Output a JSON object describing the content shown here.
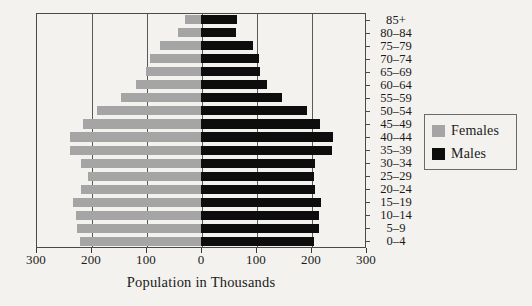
{
  "chart_data": {
    "type": "bar",
    "subtype": "population-pyramid",
    "title": "",
    "xlabel": "Population in Thousands",
    "ylabel": "",
    "xlim": [
      -300,
      300
    ],
    "xticks": [
      -300,
      -200,
      -100,
      0,
      100,
      200,
      300
    ],
    "xtick_labels": [
      "300",
      "200",
      "100",
      "0",
      "100",
      "200",
      "300"
    ],
    "grid": true,
    "grid_axis": "x",
    "legend_position": "right",
    "categories": [
      "85+",
      "80–84",
      "75–79",
      "70–74",
      "65–69",
      "60–64",
      "55–59",
      "50–54",
      "45–49",
      "40–44",
      "35–39",
      "30–34",
      "25–29",
      "20–24",
      "15–19",
      "10–14",
      "5–9",
      "0–4"
    ],
    "series": [
      {
        "name": "Females",
        "color": "#a5a5a5",
        "direction": "left",
        "values": [
          29,
          42,
          75,
          92,
          100,
          118,
          145,
          190,
          215,
          238,
          238,
          218,
          205,
          218,
          232,
          228,
          225,
          220
        ]
      },
      {
        "name": "Males",
        "color": "#0d0d0d",
        "direction": "right",
        "values": [
          65,
          64,
          95,
          105,
          108,
          120,
          148,
          192,
          216,
          240,
          238,
          208,
          205,
          208,
          218,
          215,
          215,
          205
        ]
      }
    ]
  },
  "legend": {
    "items": [
      {
        "label": "Females",
        "color": "#a5a5a5"
      },
      {
        "label": "Males",
        "color": "#0d0d0d"
      }
    ]
  }
}
